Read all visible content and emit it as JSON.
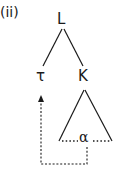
{
  "diagram": {
    "example_label": "(ii)",
    "nodes": {
      "root": "L",
      "left_child": "τ",
      "right_child": "K",
      "moved_element": "α"
    },
    "edges": [
      {
        "from": "L",
        "to": "τ",
        "style": "solid"
      },
      {
        "from": "L",
        "to": "K",
        "style": "solid"
      }
    ],
    "subtree": {
      "root": "K",
      "shape": "triangle",
      "contains": "α",
      "base_style": "dotted"
    },
    "movement_arrow": {
      "from": "α",
      "to": "τ",
      "style": "dashed",
      "arrowhead": "up"
    },
    "colors": {
      "ink": "#1a1a1a",
      "background": "#ffffff"
    }
  }
}
